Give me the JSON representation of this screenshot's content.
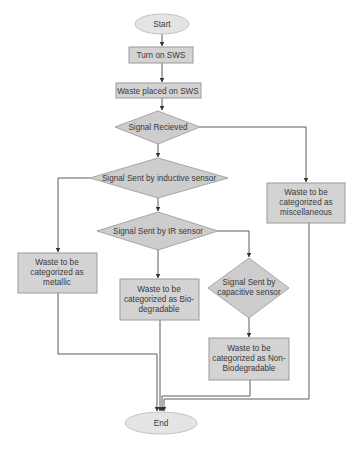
{
  "diagram": {
    "type": "flowchart",
    "colors": {
      "terminal_fill": "#e4e4e4",
      "process_fill": "#d3d3d3",
      "decision_fill": "#cdcdcd",
      "edge": "#4a4a4a",
      "text": "#3a3a3a"
    },
    "nodes": {
      "start": {
        "shape": "ellipse",
        "lines": [
          "Start"
        ]
      },
      "turn_on": {
        "shape": "process",
        "lines": [
          "Turn on SWS"
        ]
      },
      "waste_placed": {
        "shape": "process",
        "lines": [
          "Waste placed on SWS"
        ]
      },
      "signal_received": {
        "shape": "decision",
        "lines": [
          "Signal Recieved"
        ]
      },
      "inductive": {
        "shape": "decision",
        "lines": [
          "Signal Sent by inductive sensor"
        ]
      },
      "ir": {
        "shape": "decision",
        "lines": [
          "Signal Sent by IR sensor"
        ]
      },
      "capacitive": {
        "shape": "decision",
        "lines": [
          "Signal Sent by",
          "capacitive sensor"
        ]
      },
      "metallic": {
        "shape": "process",
        "lines": [
          "Waste to be",
          "categorized as",
          "metallic"
        ]
      },
      "biodegradable": {
        "shape": "process",
        "lines": [
          "Waste to be",
          "categorized as Bio-",
          "degradable"
        ]
      },
      "non_biodegradable": {
        "shape": "process",
        "lines": [
          "Waste to be",
          "categorized as Non-",
          "Biodegradable"
        ]
      },
      "miscellaneous": {
        "shape": "process",
        "lines": [
          "Waste to be",
          "categorized as",
          "miscellaneous"
        ]
      },
      "end": {
        "shape": "ellipse",
        "lines": [
          "End"
        ]
      }
    },
    "edges": [
      {
        "from": "start",
        "to": "turn_on"
      },
      {
        "from": "turn_on",
        "to": "waste_placed"
      },
      {
        "from": "waste_placed",
        "to": "signal_received"
      },
      {
        "from": "signal_received",
        "to": "inductive"
      },
      {
        "from": "signal_received",
        "to": "miscellaneous"
      },
      {
        "from": "inductive",
        "to": "metallic"
      },
      {
        "from": "inductive",
        "to": "ir"
      },
      {
        "from": "ir",
        "to": "biodegradable"
      },
      {
        "from": "ir",
        "to": "capacitive"
      },
      {
        "from": "capacitive",
        "to": "non_biodegradable"
      },
      {
        "from": "metallic",
        "to": "end"
      },
      {
        "from": "biodegradable",
        "to": "end"
      },
      {
        "from": "non_biodegradable",
        "to": "end"
      },
      {
        "from": "miscellaneous",
        "to": "end"
      }
    ]
  }
}
